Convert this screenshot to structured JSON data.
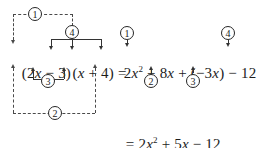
{
  "figure": {
    "lhs": {
      "text": "(2x − 3)(x + 4) =",
      "parts": [
        "(2",
        "x",
        " − 3)(",
        "x",
        " + 4) ="
      ]
    },
    "rhs": {
      "text": "2x² + 8x + (−3x) − 12",
      "terms": [
        "2x²",
        "8x",
        "(−3x)",
        "−12"
      ]
    },
    "final": {
      "text": "= 2x² + 5x − 12",
      "terms": [
        "2x²",
        "5x",
        "−12"
      ]
    },
    "steps": [
      {
        "id": "1",
        "label": "①",
        "digit": "1",
        "role": "first-terms",
        "style": "dashed"
      },
      {
        "id": "2",
        "label": "②",
        "digit": "2",
        "role": "outer-terms",
        "style": "dashed"
      },
      {
        "id": "3",
        "label": "③",
        "digit": "3",
        "role": "inner-terms",
        "style": "solid"
      },
      {
        "id": "4",
        "label": "④",
        "digit": "4",
        "role": "last-terms",
        "style": "solid"
      }
    ],
    "markers_right": [
      {
        "digit": "1",
        "points_to": "2x²"
      },
      {
        "digit": "2",
        "points_to": "8x"
      },
      {
        "digit": "3",
        "points_to": "(−3x)"
      },
      {
        "digit": "4",
        "points_to": "−12"
      }
    ],
    "colors": {
      "ink": "#1c1c1c",
      "solid_connector": "#333333",
      "dashed_connector": "#4a4a4a",
      "background": "#ffffff"
    }
  }
}
